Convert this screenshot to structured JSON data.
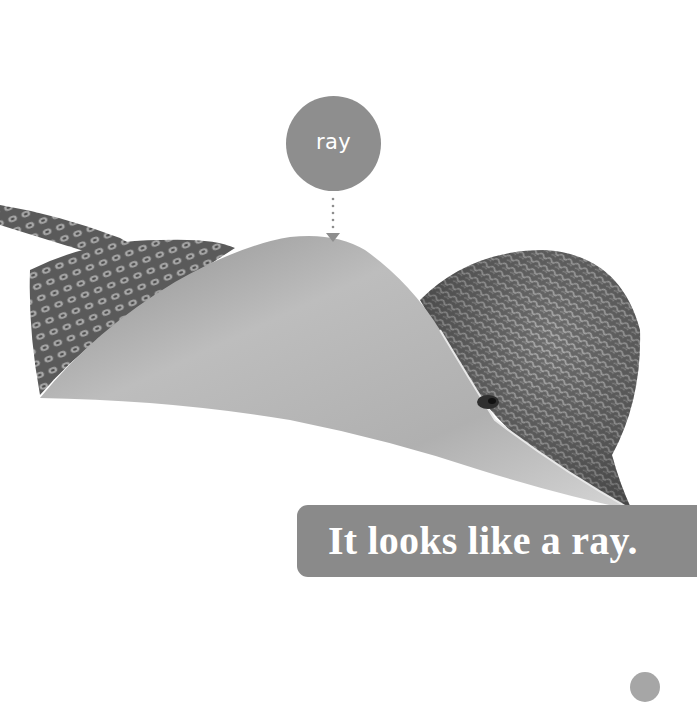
{
  "page": {
    "background": "#ffffff",
    "label_bubble": {
      "text": "ray",
      "color": "#8e8e8e"
    },
    "pointer": {
      "style": "dotted-arrow-down",
      "color": "#8e8e8e"
    },
    "illustration": {
      "subject": "ray",
      "alt": "Photo of a ray fish with patterned fins, grayscale"
    },
    "caption": {
      "text": "It looks like a ray.",
      "color": "#8a8a8a"
    },
    "page_tab": {
      "color": "#a6a6a6"
    }
  }
}
